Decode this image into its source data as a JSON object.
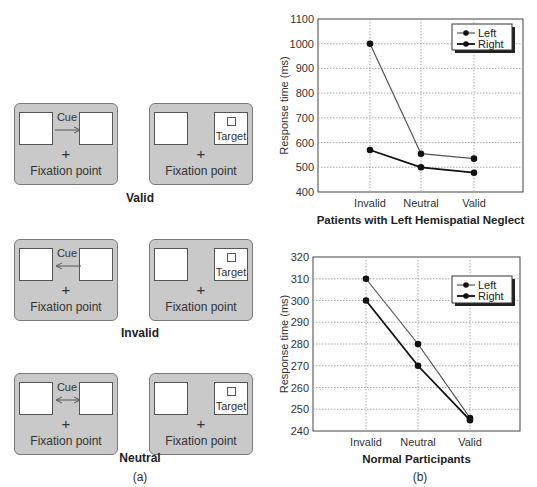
{
  "panel_a": {
    "label": "(a)",
    "conditions": [
      {
        "name": "Valid",
        "cue_label": "Cue",
        "cue_direction": "right",
        "fixation_label": "Fixation point",
        "target_label": "Target",
        "fixation_symbol": "+"
      },
      {
        "name": "Invalid",
        "cue_label": "Cue",
        "cue_direction": "left",
        "fixation_label": "Fixation point",
        "target_label": "Target",
        "fixation_symbol": "+"
      },
      {
        "name": "Neutral",
        "cue_label": "Cue",
        "cue_direction": "both",
        "fixation_label": "Fixation point",
        "target_label": "Target",
        "fixation_symbol": "+"
      }
    ]
  },
  "panel_b": {
    "label": "(b)"
  },
  "colors": {
    "screen_fill": "#c9c9c9",
    "screen_border": "#7a7a7a",
    "left_line": "#555555",
    "right_line": "#111111",
    "grid": "#999999"
  },
  "chart_data": [
    {
      "type": "line",
      "title": "Patients with Left Hemispatial Neglect",
      "xlabel": "Patients with Left Hemispatial Neglect",
      "ylabel": "Response time (ms)",
      "categories": [
        "Invalid",
        "Neutral",
        "Valid"
      ],
      "series": [
        {
          "name": "Left",
          "values": [
            1000,
            555,
            535
          ]
        },
        {
          "name": "Right",
          "values": [
            570,
            500,
            478
          ]
        }
      ],
      "ylim": [
        400,
        1100
      ],
      "yticks": [
        400,
        500,
        600,
        700,
        800,
        900,
        1000,
        1100
      ],
      "grid": true,
      "legend_position": "upper right"
    },
    {
      "type": "line",
      "title": "Normal Participants",
      "xlabel": "Normal Participants",
      "ylabel": "Response time (ms)",
      "categories": [
        "Invalid",
        "Neutral",
        "Valid"
      ],
      "series": [
        {
          "name": "Left",
          "values": [
            310,
            280,
            246
          ]
        },
        {
          "name": "Right",
          "values": [
            300,
            270,
            245
          ]
        }
      ],
      "ylim": [
        240,
        320
      ],
      "yticks": [
        240,
        250,
        260,
        270,
        280,
        290,
        300,
        310,
        320
      ],
      "grid": true,
      "legend_position": "upper right"
    }
  ]
}
